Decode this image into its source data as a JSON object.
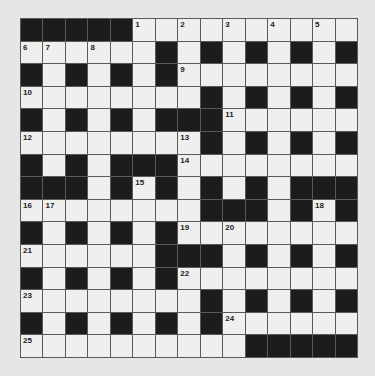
{
  "puzzle": {
    "rows": 15,
    "cols": 15,
    "colors": {
      "background": "#e6e6e4",
      "cell": "#efefed",
      "block": "#1c1c1c",
      "grid_line": "#5a5a5a"
    },
    "layout": [
      "#####1.2.3.4.5.",
      "678...#.#.#.#.#",
      "#.#.#.#9.......",
      "10.......#.#.#.#",
      "#.#.#.###11.....",
      "12......13#.#.#.#",
      "#.#.###14.......",
      "###.#15#.#.#.###",
      "1617......###.#18#",
      "#.#.#.#19.20.....",
      "21......###.#.#.#",
      "#.#.#.#22.......",
      "23........#.#.#.#",
      "#.#.#.#.#24.....",
      "25.........#####"
    ],
    "grid": [
      [
        "B",
        "B",
        "B",
        "B",
        "B",
        "1",
        "",
        "2",
        "",
        "3",
        "",
        "4",
        "",
        "5",
        ""
      ],
      [
        "6",
        "7",
        "",
        "8",
        "",
        "",
        "B",
        "",
        "B",
        "",
        "B",
        "",
        "B",
        "",
        "B"
      ],
      [
        "B",
        "",
        "B",
        "",
        "B",
        "",
        "B",
        "9",
        "",
        "",
        "",
        "",
        "",
        "",
        ""
      ],
      [
        "10",
        "",
        "",
        "",
        "",
        "",
        "",
        "",
        "B",
        "",
        "B",
        "",
        "B",
        "",
        "B"
      ],
      [
        "B",
        "",
        "B",
        "",
        "B",
        "",
        "B",
        "B",
        "B",
        "11",
        "",
        "",
        "",
        "",
        ""
      ],
      [
        "12",
        "",
        "",
        "",
        "",
        "",
        "",
        "13",
        "B",
        "",
        "B",
        "",
        "B",
        "",
        "B"
      ],
      [
        "B",
        "",
        "B",
        "",
        "B",
        "B",
        "B",
        "14",
        "",
        "",
        "",
        "",
        "",
        "",
        ""
      ],
      [
        "B",
        "B",
        "B",
        "",
        "B",
        "15",
        "B",
        "",
        "B",
        "",
        "B",
        "",
        "B",
        "B",
        "B"
      ],
      [
        "16",
        "17",
        "",
        "",
        "",
        "",
        "",
        "",
        "B",
        "B",
        "B",
        "",
        "B",
        "18",
        "B"
      ],
      [
        "B",
        "",
        "B",
        "",
        "B",
        "",
        "B",
        "19",
        "",
        "20",
        "",
        "",
        "",
        "",
        ""
      ],
      [
        "21",
        "",
        "",
        "",
        "",
        "",
        "B",
        "B",
        "B",
        "",
        "B",
        "",
        "B",
        "",
        "B"
      ],
      [
        "B",
        "",
        "B",
        "",
        "B",
        "",
        "B",
        "22",
        "",
        "",
        "",
        "",
        "",
        "",
        ""
      ],
      [
        "23",
        "",
        "",
        "",
        "",
        "",
        "",
        "",
        "B",
        "",
        "B",
        "",
        "B",
        "",
        "B"
      ],
      [
        "B",
        "",
        "B",
        "",
        "B",
        "",
        "B",
        "",
        "B",
        "24",
        "",
        "",
        "",
        "",
        ""
      ],
      [
        "25",
        "",
        "",
        "",
        "",
        "",
        "",
        "",
        "",
        "",
        "B",
        "B",
        "B",
        "B",
        "B"
      ]
    ]
  }
}
